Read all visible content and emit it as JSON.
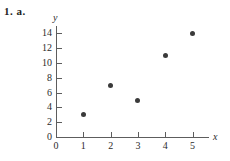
{
  "problem": {
    "label": "1. a."
  },
  "chart_data": {
    "type": "scatter",
    "title": "",
    "xlabel": "x",
    "ylabel": "y",
    "x": [
      1,
      2,
      3,
      4,
      5
    ],
    "values": [
      3,
      7,
      5,
      11,
      14
    ],
    "points": [
      {
        "x": 1,
        "y": 3
      },
      {
        "x": 2,
        "y": 7
      },
      {
        "x": 3,
        "y": 5
      },
      {
        "x": 4,
        "y": 11
      },
      {
        "x": 5,
        "y": 14
      }
    ],
    "xticks": [
      0,
      1,
      2,
      3,
      4,
      5
    ],
    "yticks": [
      0,
      2,
      4,
      6,
      8,
      10,
      12,
      14
    ],
    "xlim": [
      0,
      5.6
    ],
    "ylim": [
      0,
      15
    ],
    "grid": false,
    "legend": false,
    "marker_color": "#3a3a3a",
    "axis_color": "#5d5d5d"
  }
}
